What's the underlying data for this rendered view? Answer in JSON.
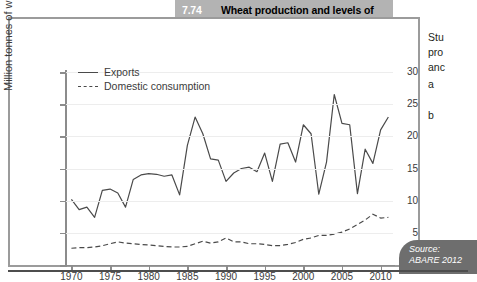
{
  "title": {
    "number": "7.74",
    "text": "Wheat production and levels of exports and domestic consumption"
  },
  "source": {
    "label": "Source:",
    "citation": "ABARE 2012"
  },
  "right_column": {
    "lines": [
      "Stu",
      "pro",
      "anc"
    ],
    "item_a": "a",
    "item_b": "b"
  },
  "chart_data": {
    "type": "line",
    "title": "Wheat production and levels of exports and domestic consumption",
    "xlabel": "",
    "ylabel": "Million tonnes of wheat",
    "xlim": [
      1969.3,
      2011.6
    ],
    "ylim": [
      0,
      30
    ],
    "grid": true,
    "legend_position": "top-left",
    "yticks": [
      0,
      5,
      10,
      15,
      20,
      25,
      30
    ],
    "ytick_labels": [
      "0",
      "5",
      "10",
      "15",
      "20",
      "25",
      "30"
    ],
    "xticks": [
      1970,
      1975,
      1980,
      1985,
      1990,
      1995,
      2000,
      2005,
      2010
    ],
    "xtick_labels": [
      "1970",
      "1975",
      "1980",
      "1985",
      "1990",
      "1995",
      "2000",
      "2005",
      "2010"
    ],
    "x": [
      1970,
      1971,
      1972,
      1973,
      1974,
      1975,
      1976,
      1977,
      1978,
      1979,
      1980,
      1981,
      1982,
      1983,
      1984,
      1985,
      1986,
      1987,
      1988,
      1989,
      1990,
      1991,
      1992,
      1993,
      1994,
      1995,
      1996,
      1997,
      1998,
      1999,
      2000,
      2001,
      2002,
      2003,
      2004,
      2005,
      2006,
      2007,
      2008,
      2009,
      2010,
      2011
    ],
    "series": [
      {
        "name": "Exports",
        "style": "solid",
        "color": "#4a4a4a",
        "values": [
          10.2,
          8.6,
          9.0,
          7.4,
          11.6,
          11.8,
          11.2,
          9.0,
          13.3,
          14.0,
          14.2,
          14.1,
          13.8,
          14.0,
          10.9,
          18.6,
          23.0,
          20.4,
          16.5,
          16.3,
          13.0,
          14.3,
          15.0,
          15.2,
          14.5,
          17.4,
          13.0,
          18.8,
          19.0,
          16.0,
          21.8,
          20.4,
          11.0,
          16.0,
          26.5,
          22.0,
          21.8,
          11.1,
          18.0,
          15.8,
          21.0,
          23.0
        ]
      },
      {
        "name": "Domestic consumption",
        "style": "dashed",
        "color": "#4a4a4a",
        "values": [
          2.6,
          2.7,
          2.7,
          2.8,
          3.0,
          3.3,
          3.6,
          3.4,
          3.3,
          3.2,
          3.1,
          3.0,
          2.9,
          2.8,
          2.8,
          2.9,
          3.3,
          3.7,
          3.4,
          3.6,
          4.2,
          3.6,
          3.6,
          3.3,
          3.3,
          3.2,
          3.0,
          3.0,
          3.2,
          3.5,
          4.0,
          4.2,
          4.6,
          4.6,
          4.8,
          5.1,
          5.6,
          6.3,
          7.0,
          7.9,
          7.3,
          7.4
        ]
      }
    ]
  }
}
